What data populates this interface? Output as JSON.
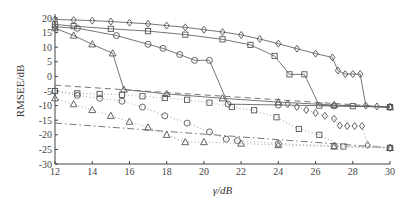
{
  "chart_data": {
    "type": "line",
    "title": "",
    "xlabel": "γ/dB",
    "ylabel": "RMSEE/dB",
    "xlim": [
      12,
      30
    ],
    "ylim": [
      -30,
      20
    ],
    "xticks": [
      12,
      14,
      16,
      18,
      20,
      22,
      24,
      26,
      28,
      30
    ],
    "yticks": [
      20,
      15,
      10,
      5,
      0,
      -5,
      -10,
      -15,
      -20,
      -25,
      -30
    ],
    "grid": false,
    "legend": "none",
    "series": [
      {
        "name": "diamond-solid",
        "marker": "diamond",
        "style": "solid",
        "x": [
          12,
          13,
          14,
          15,
          16,
          17,
          18,
          19,
          20,
          21,
          22,
          23,
          24,
          25,
          26,
          26.9,
          27.2,
          27.6,
          28.0,
          28.4,
          28.7,
          29.3,
          30
        ],
        "y": [
          19.5,
          19.3,
          19.1,
          18.8,
          18.4,
          18.0,
          17.4,
          16.8,
          16.0,
          15.2,
          14.2,
          12.8,
          11.2,
          9.5,
          7.8,
          6.5,
          2.0,
          0.8,
          0.8,
          0.8,
          -10.0,
          -10.3,
          -10.5
        ]
      },
      {
        "name": "square-solid",
        "marker": "square",
        "style": "solid",
        "x": [
          12,
          13,
          15,
          17,
          19,
          21,
          22.5,
          23.8,
          24.6,
          25.4,
          26.2,
          28,
          30
        ],
        "y": [
          17.8,
          17.2,
          16.3,
          15.5,
          14.3,
          12.7,
          10.8,
          7.0,
          0.7,
          0.7,
          -10.0,
          -10.2,
          -10.5
        ]
      },
      {
        "name": "circle-solid",
        "marker": "circle",
        "style": "solid",
        "x": [
          12,
          13.2,
          15.3,
          17,
          17.8,
          18.7,
          19.5,
          20.3,
          21.3,
          24,
          27,
          30
        ],
        "y": [
          17.0,
          16.5,
          14.0,
          11.0,
          9.6,
          7.5,
          5.5,
          5.5,
          -9.5,
          -9.8,
          -10.1,
          -10.5
        ]
      },
      {
        "name": "triangle-solid",
        "marker": "triangle",
        "style": "solid",
        "x": [
          12,
          13,
          14,
          15.1,
          15.7,
          18,
          21,
          24,
          27,
          30
        ],
        "y": [
          16.5,
          14.0,
          11.0,
          7.9,
          -4.5,
          -6.0,
          -7.5,
          -8.8,
          -9.8,
          -10.5
        ]
      },
      {
        "name": "upper-dashed",
        "marker": "none",
        "style": "dashed",
        "x": [
          12,
          30
        ],
        "y": [
          -3.0,
          -10.5
        ]
      },
      {
        "name": "lower-dashdot",
        "marker": "none",
        "style": "dashdot",
        "x": [
          12,
          30
        ],
        "y": [
          -16.0,
          -24.5
        ]
      },
      {
        "name": "diamond-dotted",
        "marker": "diamond",
        "style": "dotted",
        "x": [
          24.5,
          25,
          25.5,
          26,
          26.5,
          27,
          27.3,
          27.7,
          28.1,
          28.5,
          28.8,
          30
        ],
        "y": [
          -9.5,
          -10.5,
          -11.5,
          -12.5,
          -13.5,
          -14.5,
          -16.8,
          -17,
          -17,
          -17,
          -23.5,
          -24.5
        ]
      },
      {
        "name": "square-dotted",
        "marker": "square",
        "style": "dotted",
        "x": [
          12,
          13.2,
          14.4,
          15.6,
          16.7,
          17.9,
          19.1,
          20.3,
          21.5,
          22.7,
          23.9,
          25.1,
          26.2,
          27.5,
          30
        ],
        "y": [
          -5.0,
          -5.8,
          -6.0,
          -6.3,
          -6.8,
          -7.4,
          -8.0,
          -9.0,
          -10.5,
          -11.6,
          -14.0,
          -18.0,
          -20.0,
          -24.0,
          -24.5
        ]
      },
      {
        "name": "circle-dotted",
        "marker": "circle",
        "style": "dotted",
        "x": [
          12,
          13.2,
          14.4,
          15.6,
          16.7,
          17.9,
          19.1,
          20.3,
          21.2,
          21.8,
          24,
          27,
          30
        ],
        "y": [
          -5.0,
          -6.5,
          -7.5,
          -8.5,
          -10.5,
          -13.5,
          -16.0,
          -19.0,
          -21.5,
          -22.0,
          -23.0,
          -23.8,
          -24.5
        ]
      },
      {
        "name": "triangle-dotted",
        "marker": "triangle",
        "style": "dotted",
        "x": [
          12,
          13,
          14,
          15,
          16,
          17,
          18,
          19,
          20,
          22,
          24,
          27,
          30
        ],
        "y": [
          -7.5,
          -9.5,
          -11.5,
          -13.5,
          -15.5,
          -17.5,
          -20.0,
          -22.5,
          -22.5,
          -23.0,
          -23.5,
          -24.0,
          -24.5
        ]
      }
    ]
  }
}
